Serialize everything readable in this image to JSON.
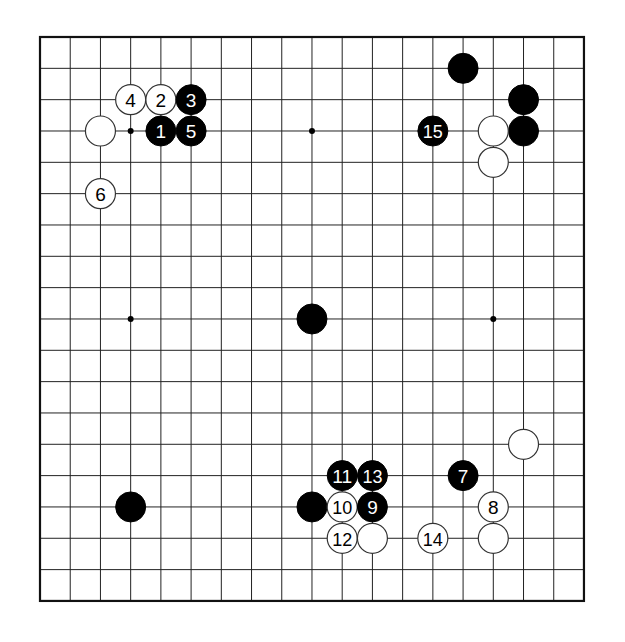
{
  "board": {
    "size": 19,
    "origin_x": 40,
    "origin_y": 37,
    "spacing_x": 30.22,
    "spacing_y": 31.33,
    "stone_radius": 15,
    "line_color": "#222222",
    "border_color": "#111111",
    "black_color": "#000000",
    "white_fill": "#ffffff",
    "white_stroke": "#333333",
    "star_points": [
      [
        3,
        3
      ],
      [
        9,
        3
      ],
      [
        15,
        3
      ],
      [
        3,
        9
      ],
      [
        9,
        9
      ],
      [
        15,
        9
      ],
      [
        3,
        15
      ],
      [
        9,
        15
      ],
      [
        15,
        15
      ]
    ]
  },
  "stones": [
    {
      "color": "white",
      "col": 2,
      "row": 3,
      "label": ""
    },
    {
      "color": "white",
      "col": 3,
      "row": 2,
      "label": "4"
    },
    {
      "color": "white",
      "col": 4,
      "row": 2,
      "label": "2"
    },
    {
      "color": "black",
      "col": 5,
      "row": 2,
      "label": "3"
    },
    {
      "color": "black",
      "col": 4,
      "row": 3,
      "label": "1"
    },
    {
      "color": "black",
      "col": 5,
      "row": 3,
      "label": "5"
    },
    {
      "color": "white",
      "col": 2,
      "row": 5,
      "label": "6"
    },
    {
      "color": "black",
      "col": 14,
      "row": 1,
      "label": ""
    },
    {
      "color": "black",
      "col": 16,
      "row": 2,
      "label": ""
    },
    {
      "color": "black",
      "col": 16,
      "row": 3,
      "label": ""
    },
    {
      "color": "white",
      "col": 15,
      "row": 3,
      "label": ""
    },
    {
      "color": "white",
      "col": 15,
      "row": 4,
      "label": ""
    },
    {
      "color": "black",
      "col": 13,
      "row": 3,
      "label": "15"
    },
    {
      "color": "black",
      "col": 9,
      "row": 9,
      "label": ""
    },
    {
      "color": "white",
      "col": 16,
      "row": 13,
      "label": ""
    },
    {
      "color": "black",
      "col": 14,
      "row": 14,
      "label": "7"
    },
    {
      "color": "white",
      "col": 15,
      "row": 15,
      "label": "8"
    },
    {
      "color": "white",
      "col": 15,
      "row": 16,
      "label": ""
    },
    {
      "color": "white",
      "col": 13,
      "row": 16,
      "label": "14"
    },
    {
      "color": "black",
      "col": 10,
      "row": 14,
      "label": "11"
    },
    {
      "color": "black",
      "col": 11,
      "row": 14,
      "label": "13"
    },
    {
      "color": "black",
      "col": 9,
      "row": 15,
      "label": ""
    },
    {
      "color": "white",
      "col": 10,
      "row": 15,
      "label": "10"
    },
    {
      "color": "black",
      "col": 11,
      "row": 15,
      "label": "9"
    },
    {
      "color": "white",
      "col": 10,
      "row": 16,
      "label": "12"
    },
    {
      "color": "white",
      "col": 11,
      "row": 16,
      "label": ""
    },
    {
      "color": "black",
      "col": 3,
      "row": 15,
      "label": ""
    }
  ]
}
